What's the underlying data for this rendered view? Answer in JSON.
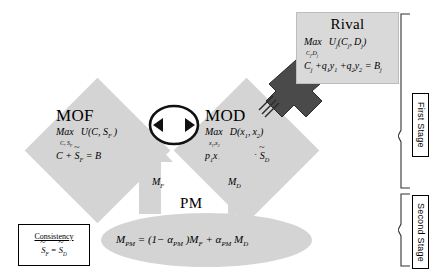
{
  "diagram": {
    "nodes": {
      "mof": {
        "title": "MOF",
        "objective_prefix": "Max",
        "objective": "U(C, S_F)",
        "choice_vars": "C, S_F",
        "constraint": "C + S̄_F = B"
      },
      "mod": {
        "title": "MOD",
        "objective_prefix": "Max",
        "objective": "D(x_1, x_2)",
        "choice_vars": "x_1, x_2",
        "constraint": "p_1x_1 + p_2x_2 = S̃_D"
      },
      "rival": {
        "title": "Rival",
        "objective_prefix": "Max",
        "objective": "U_j(C_j, D_j)",
        "choice_vars": "C_j, D_j",
        "constraint": "C_j + q_1y_1 + q_2y_2 = B_j"
      },
      "pm": {
        "title": "PM",
        "equation": "M_PM = (1 - α_PM) M_F + α_PM M_D"
      },
      "consistency": {
        "title": "Consistency",
        "equation": "S̃_F = S̃_D"
      }
    },
    "arrow_labels": {
      "mf": "M_F",
      "md": "M_D"
    },
    "stages": {
      "first": "First Stage",
      "second": "Second Stage"
    },
    "colors": {
      "node_fill": "#d4d4d4",
      "rival_fill": "#d9d9d9",
      "arrow_dark": "#4d4d4d",
      "arrow_light": "#d4d4d4",
      "stroke": "#000000"
    }
  }
}
